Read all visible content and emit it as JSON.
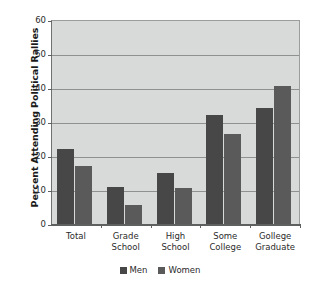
{
  "chart_data": {
    "type": "bar",
    "title": "",
    "xlabel": "",
    "ylabel": "Percent Attending Political Rallies",
    "ylim": [
      0,
      60
    ],
    "yticks": [
      0,
      10,
      20,
      30,
      40,
      50,
      60
    ],
    "grid": true,
    "legend_position": "bottom-center",
    "categories": [
      "Total",
      "Grade\nSchool",
      "High\nSchool",
      "Some\nCollege",
      "Gollege\nGraduate"
    ],
    "series": [
      {
        "name": "Men",
        "color": "#474747",
        "values": [
          22,
          11,
          15,
          32,
          34
        ]
      },
      {
        "name": "Women",
        "color": "#5a5a5a",
        "values": [
          17,
          5.5,
          10.5,
          26.5,
          40.5
        ]
      }
    ],
    "colors": {
      "plot_background": "#d7dad8",
      "gridline": "#8e918f",
      "axis": "#5d605e",
      "text": "#2b2b2b",
      "figure_background": "#ffffff"
    }
  }
}
